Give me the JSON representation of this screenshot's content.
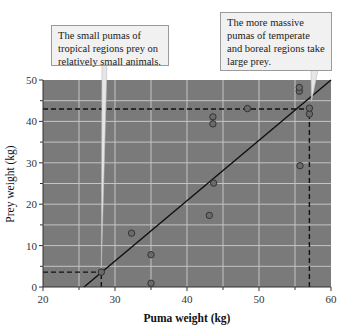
{
  "chart_data": {
    "type": "scatter",
    "title": "",
    "xlabel": "Puma weight (kg)",
    "ylabel": "Prey weight (kg)",
    "xlim": [
      20,
      60
    ],
    "ylim": [
      0,
      50
    ],
    "x_ticks": [
      20,
      30,
      40,
      50,
      60
    ],
    "y_ticks": [
      0,
      10,
      20,
      30,
      40,
      50
    ],
    "grid": true,
    "grid_step": 5,
    "legend": null,
    "series": [
      {
        "name": "pumas",
        "points": [
          {
            "x": 28.1,
            "y": 3.6
          },
          {
            "x": 32.3,
            "y": 13.0
          },
          {
            "x": 35.0,
            "y": 7.8
          },
          {
            "x": 35.0,
            "y": 0.9
          },
          {
            "x": 43.1,
            "y": 17.3
          },
          {
            "x": 43.7,
            "y": 25.1
          },
          {
            "x": 43.6,
            "y": 39.4
          },
          {
            "x": 43.6,
            "y": 41.1
          },
          {
            "x": 48.4,
            "y": 43.1
          },
          {
            "x": 55.6,
            "y": 47.3
          },
          {
            "x": 55.6,
            "y": 48.2
          },
          {
            "x": 55.7,
            "y": 29.3
          },
          {
            "x": 57.0,
            "y": 41.8
          },
          {
            "x": 57.0,
            "y": 43.2
          }
        ]
      }
    ],
    "regression_line": {
      "x1": 25.7,
      "y1": 0,
      "x2": 60,
      "y2": 50
    },
    "reference_lines": [
      {
        "type": "h",
        "y": 43,
        "x_from": 20,
        "x_to": 57
      },
      {
        "type": "v",
        "x": 57,
        "y_from": 0,
        "y_to": 43
      },
      {
        "type": "h",
        "y": 3.6,
        "x_from": 20,
        "x_to": 28.1
      },
      {
        "type": "v",
        "x": 28.1,
        "y_from": 0,
        "y_to": 3.6
      }
    ],
    "annotations": [
      {
        "text": "The small pumas of tropical regions prey on relatively small animals.",
        "points_to": {
          "x": 28.1,
          "y": 3.6
        }
      },
      {
        "text": "The more massive pumas of temperate and boreal regions take large prey.",
        "points_to": {
          "x": 57.0,
          "y": 45.3
        }
      }
    ]
  },
  "labels": {
    "xlabel": "Puma weight (kg)",
    "ylabel": "Prey weight (kg)",
    "x_ticks": [
      "20",
      "30",
      "40",
      "50",
      "60"
    ],
    "y_ticks": [
      "0",
      "10",
      "20",
      "30",
      "40",
      "50"
    ],
    "callout_left": "The small pumas of tropical regions prey on relatively small animals.",
    "callout_right": "The more massive pumas of temperate and boreal regions take large prey."
  },
  "colors": {
    "plot_bg": "#7a7a7a",
    "grid": "#c4c4c4",
    "point_fill": "#6a6a6a",
    "point_stroke": "#333333",
    "line": "#111111",
    "callout_bg": "#f1f1f1"
  }
}
